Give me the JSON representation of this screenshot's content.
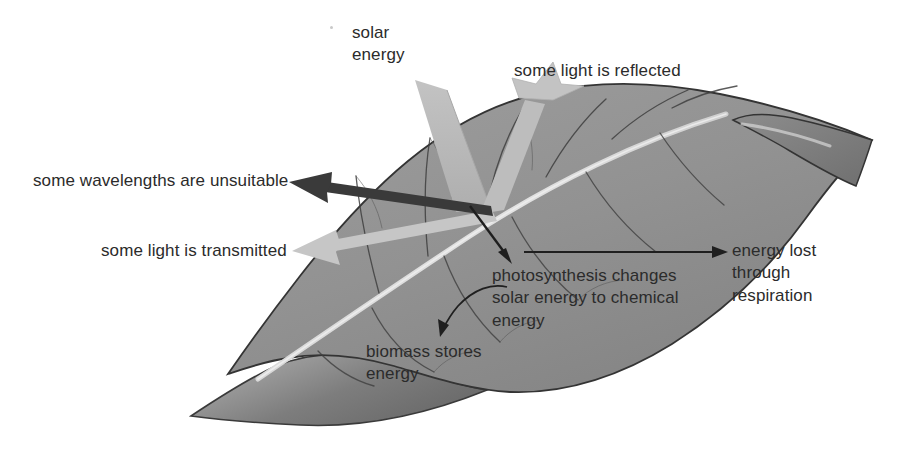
{
  "figure": {
    "kind": "leaf-energy-flow-diagram",
    "background_color": "#ffffff"
  },
  "colors": {
    "leaf_fill": "#8f8f8f",
    "leaf_fill_light": "#9d9d9d",
    "leaf_edge": "#3a3a3a",
    "leaf_underside": "#6e6e6e",
    "midrib": "#d8d8d8",
    "vein": "#4a4a4a",
    "beam_light": "#b9b9b9",
    "beam_light_pale": "#c4c4c4",
    "arrow_dark": "#333333",
    "arrow_thin": "#1f1f1f",
    "text": "#2b2b2b"
  },
  "labels": {
    "solar_energy": "solar\nenergy",
    "reflected": "some light is reflected",
    "unsuitable": "some wavelengths are unsuitable",
    "transmitted": "some light is transmitted",
    "photosynthesis": "photosynthesis changes\nsolar energy to chemical\nenergy",
    "energy_lost": "energy lost\nthrough\nrespiration",
    "biomass": "biomass stores\nenergy"
  },
  "flows": [
    {
      "name": "solar-energy-beam",
      "label_key": "solar_energy",
      "style": "thick-light-band",
      "from": [
        428,
        88
      ],
      "to": [
        478,
        210
      ],
      "color": "#b9b9b9"
    },
    {
      "name": "reflected-beam",
      "label_key": "reflected",
      "style": "thick-light-band-arrow",
      "from": [
        484,
        214
      ],
      "to": [
        551,
        84
      ],
      "color": "#bfbfbf"
    },
    {
      "name": "unsuitable-wavelengths-arrow",
      "label_key": "unsuitable",
      "style": "thick-dark-arrow",
      "from": [
        492,
        212
      ],
      "to": [
        292,
        182
      ],
      "color": "#333333"
    },
    {
      "name": "transmitted-beam",
      "label_key": "transmitted",
      "style": "thick-light-band-arrow",
      "from": [
        489,
        214
      ],
      "to": [
        292,
        253
      ],
      "color": "#c4c4c4"
    },
    {
      "name": "photosynthesis-arrow",
      "label_key": "photosynthesis",
      "style": "thin-dark-arrow",
      "from": [
        473,
        208
      ],
      "to": [
        512,
        262
      ],
      "color": "#1f1f1f"
    },
    {
      "name": "energy-lost-arrow",
      "label_key": "energy_lost",
      "style": "thin-dark-arrow",
      "from": [
        527,
        252
      ],
      "to": [
        726,
        252
      ],
      "color": "#1f1f1f"
    },
    {
      "name": "biomass-arrow",
      "label_key": "biomass",
      "style": "thin-dark-curved-arrow",
      "from": [
        504,
        288
      ],
      "to": [
        442,
        334
      ],
      "color": "#1f1f1f"
    }
  ]
}
